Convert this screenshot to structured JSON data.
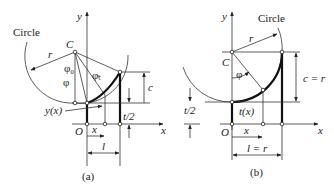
{
  "panel_a": {
    "caption": "(a)",
    "labels": {
      "circle": "Circle",
      "r": "r",
      "C": "C",
      "phi0": "φ₀",
      "phi": "φ",
      "phi_t": "φₜ",
      "c": "c",
      "t_half": "t/2",
      "y_x": "y(x)",
      "O": "O",
      "x_dim": "x",
      "l": "l",
      "x_axis": "x",
      "y_axis": "y"
    }
  },
  "panel_b": {
    "caption": "(b)",
    "labels": {
      "circle": "Circle",
      "r": "r",
      "C": "C",
      "phi": "φ",
      "c_eq_r": "c = r",
      "t_half": "t/2",
      "t_x": "t(x)",
      "O": "O",
      "x_dim": "x",
      "l_eq_r": "l = r",
      "x_axis": "x",
      "y_axis": "y"
    }
  },
  "colors": {
    "line": "#222222",
    "background": "#ffffff"
  }
}
